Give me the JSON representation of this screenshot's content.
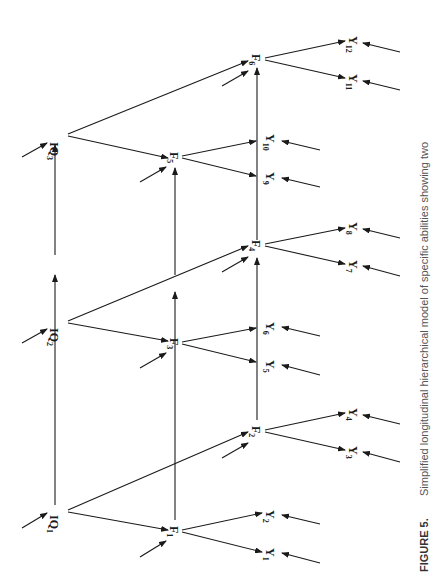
{
  "caption": {
    "label": "FIGURE 5.",
    "text": "Simplified longitudinal hierarchical model of specific abilities showing two"
  },
  "nodes": {
    "IQ1": {
      "base": "IQ",
      "sub": "1"
    },
    "IQ2": {
      "base": "IQ",
      "sub": "2"
    },
    "IQ3": {
      "base": "IQ",
      "sub": "3"
    },
    "F1": {
      "base": "F",
      "sub": "1"
    },
    "F2": {
      "base": "F",
      "sub": "2"
    },
    "F3": {
      "base": "F",
      "sub": "3"
    },
    "F4": {
      "base": "F",
      "sub": "4"
    },
    "F5": {
      "base": "F",
      "sub": "5"
    },
    "F6": {
      "base": "F",
      "sub": "6"
    },
    "Y1": {
      "base": "Y",
      "sub": "1"
    },
    "Y2": {
      "base": "Y",
      "sub": "2"
    },
    "Y3": {
      "base": "Y",
      "sub": "3"
    },
    "Y4": {
      "base": "Y",
      "sub": "4"
    },
    "Y5": {
      "base": "Y",
      "sub": "5"
    },
    "Y6": {
      "base": "Y",
      "sub": "6"
    },
    "Y7": {
      "base": "Y",
      "sub": "7"
    },
    "Y8": {
      "base": "Y",
      "sub": "8"
    },
    "Y9": {
      "base": "Y",
      "sub": "9"
    },
    "Y10": {
      "base": "Y",
      "sub": "10"
    },
    "Y11": {
      "base": "Y",
      "sub": "11"
    },
    "Y12": {
      "base": "Y",
      "sub": "12"
    }
  },
  "edges": [
    [
      "IQ1",
      "IQ2"
    ],
    [
      "IQ2",
      "IQ3"
    ],
    [
      "IQ1",
      "F1"
    ],
    [
      "IQ1",
      "F2"
    ],
    [
      "IQ2",
      "F3"
    ],
    [
      "IQ2",
      "F4"
    ],
    [
      "IQ3",
      "F5"
    ],
    [
      "IQ3",
      "F6"
    ],
    [
      "F1",
      "F3"
    ],
    [
      "F3",
      "F5"
    ],
    [
      "F2",
      "F4"
    ],
    [
      "F4",
      "F6"
    ],
    [
      "F1",
      "Y1"
    ],
    [
      "F1",
      "Y2"
    ],
    [
      "F2",
      "Y3"
    ],
    [
      "F2",
      "Y4"
    ],
    [
      "F3",
      "Y5"
    ],
    [
      "F3",
      "Y6"
    ],
    [
      "F4",
      "Y7"
    ],
    [
      "F4",
      "Y8"
    ],
    [
      "F5",
      "Y9"
    ],
    [
      "F5",
      "Y10"
    ],
    [
      "F6",
      "Y11"
    ],
    [
      "F6",
      "Y12"
    ]
  ],
  "orientation": "rotated 90 degrees counter-clockwise"
}
